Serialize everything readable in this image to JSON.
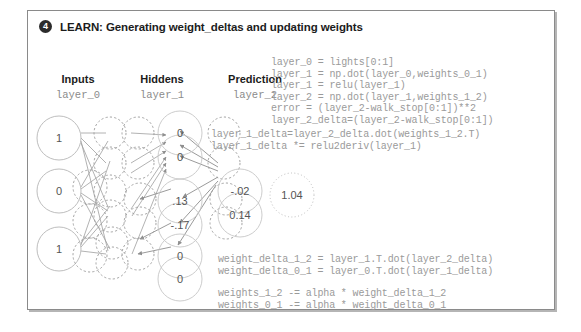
{
  "header": {
    "badge": "4",
    "title": "LEARN: Generating weight_deltas and updating weights"
  },
  "columns": [
    {
      "title": "Inputs",
      "sub": "layer_0"
    },
    {
      "title": "Hiddens",
      "sub": "layer_1"
    },
    {
      "title": "Prediction",
      "sub": "layer_2"
    }
  ],
  "network": {
    "input_values": [
      "1",
      "0",
      "1"
    ],
    "hidden_values": [
      "0",
      "0",
      ".13",
      "-.17",
      "0",
      "0"
    ],
    "prediction_values": [
      "-.02",
      "0.14"
    ],
    "goal_value": "1.04"
  },
  "code": {
    "forward": "layer_0 = lights[0:1]\nlayer_1 = np.dot(layer_0,weights_0_1)\nlayer_1 = relu(layer_1)\nlayer_2 = np.dot(layer_1,weights_1_2)\nerror = (layer_2-walk_stop[0:1])**2\nlayer_2_delta=(layer_2-walk_stop[0:1])",
    "layer1_delta": "layer_1_delta=layer_2_delta.dot(weights_1_2.T)\nlayer_1_delta *= relu2deriv(layer_1)",
    "weight_delta": "weight_delta_1_2 = layer_1.T.dot(layer_2_delta)\nweight_delta_0_1 = layer_0.T.dot(layer_1_delta)",
    "weight_update": "weights_1_2 -= alpha * weight_delta_1_2\nweights_0_1 -= alpha * weight_delta_0_1"
  },
  "colors": {
    "panel_border": "#8a8a8a",
    "badge_bg": "#2b2b2b",
    "code_text": "#9a9a9a",
    "node_stroke": "#b5b5b5",
    "edge_stroke": "#9e9e9e"
  }
}
